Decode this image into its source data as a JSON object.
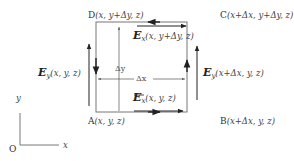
{
  "diagram": {
    "colors": {
      "box": "#777777",
      "arrow": "#222222",
      "text": "#333333",
      "background": "#ffffff"
    },
    "corners": {
      "A": {
        "letter": "A",
        "coords": "(x, y, z)"
      },
      "B": {
        "letter": "B",
        "coords": "(x+Δx, y, z)"
      },
      "C": {
        "letter": "C",
        "coords": "(x+Δx, y+Δy, z)"
      },
      "D": {
        "letter": "D",
        "coords": "(x, y+Δy, z)"
      }
    },
    "fields": {
      "ex_bottom": {
        "symbol": "E",
        "sub": "x",
        "args": "(x, y, z)"
      },
      "ex_top": {
        "symbol": "E",
        "sub": "x",
        "args": "(x, y+Δy, z)"
      },
      "ey_left": {
        "symbol": "E",
        "sub": "y",
        "args": "(x, y, z)"
      },
      "ey_right": {
        "symbol": "E",
        "sub": "y",
        "args": "(x+Δx, y, z)"
      }
    },
    "dimensions": {
      "dx": "Δx",
      "dy": "Δy"
    },
    "axes": {
      "origin": "O",
      "x_label": "x",
      "y_label": "y"
    }
  }
}
